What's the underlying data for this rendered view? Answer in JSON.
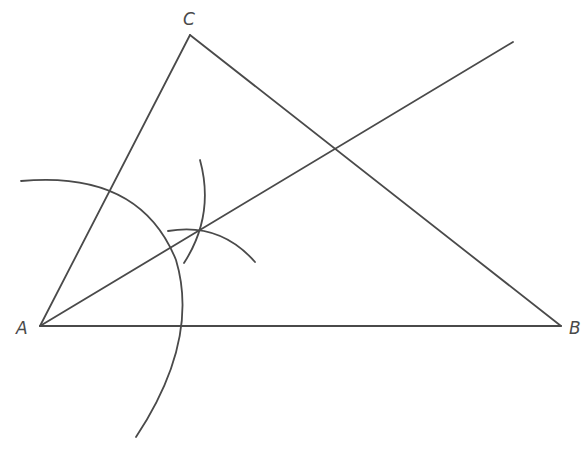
{
  "diagram": {
    "stroke_color": "#4a4a4a",
    "points": {
      "A": {
        "label": "A",
        "x": 40,
        "y": 326
      },
      "B": {
        "label": "B",
        "x": 561,
        "y": 326
      },
      "C": {
        "label": "C",
        "x": 190,
        "y": 35
      }
    },
    "segments": [
      {
        "name": "AB",
        "from": "A",
        "to": "B"
      },
      {
        "name": "AC",
        "from": "A",
        "to": "C"
      },
      {
        "name": "BC",
        "from": "B",
        "to": "C"
      }
    ],
    "bisector": {
      "from": "A",
      "end": {
        "x": 513,
        "y": 42
      }
    },
    "arcs": [
      {
        "name": "arc-centered-at-A",
        "description": "Large arc centered at A cutting AC and AB"
      },
      {
        "name": "arc-from-AC-intersection",
        "description": "Small arc crossing bisector"
      },
      {
        "name": "arc-from-AB-intersection",
        "description": "Small arc crossing bisector"
      }
    ]
  }
}
